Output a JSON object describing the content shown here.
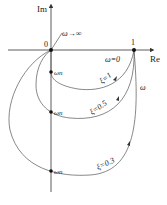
{
  "diagram": {
    "type": "nyquist-plot",
    "axes": {
      "imag_label": "Im",
      "real_label": "Re",
      "origin_label": "0",
      "unit_point_label": "1"
    },
    "annotations": {
      "omega_infinity": "ω→∞",
      "omega_zero": "ω=0",
      "omega_direction": "ω",
      "natural_freq": "ωn"
    },
    "curves": [
      {
        "label": "ξ=1",
        "damping": 1
      },
      {
        "label": "ξ=0.5",
        "damping": 0.5
      },
      {
        "label": "ξ=0.3",
        "damping": 0.3
      }
    ],
    "colors": {
      "axis": "#333333",
      "curve": "#555555",
      "text": "#222222"
    }
  }
}
